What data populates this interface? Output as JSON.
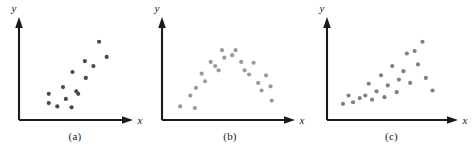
{
  "figure": {
    "background_color": "#ffffff",
    "panel_count": 3
  },
  "panels": [
    {
      "id": "panel-a",
      "caption": "(a)",
      "x_axis_label": "x",
      "y_axis_label": "y",
      "dot_color": "#4a4a4a",
      "axis_color": "#1a1a1a"
    },
    {
      "id": "panel-b",
      "caption": "(b)",
      "x_axis_label": "x",
      "y_axis_label": "y",
      "dot_color": "#9a9a9a",
      "axis_color": "#1a1a1a"
    },
    {
      "id": "panel-c",
      "caption": "(c)",
      "x_axis_label": "x",
      "y_axis_label": "y",
      "dot_color": "#808080",
      "axis_color": "#1a1a1a"
    }
  ],
  "chart_data": [
    {
      "type": "scatter",
      "title": "(a)",
      "xlabel": "x",
      "ylabel": "y",
      "grid": false,
      "legend": "none",
      "xlim": [
        0,
        100
      ],
      "ylim": [
        0,
        100
      ],
      "series": [
        {
          "name": "positive linear association",
          "color": "#4a4a4a",
          "points": [
            [
              25,
              24
            ],
            [
              25,
              13
            ],
            [
              34,
              9
            ],
            [
              40,
              32
            ],
            [
              43,
              18
            ],
            [
              49,
              8
            ],
            [
              50,
              50
            ],
            [
              54,
              27
            ],
            [
              56,
              24
            ],
            [
              63,
              63
            ],
            [
              64,
              43
            ],
            [
              72,
              57
            ],
            [
              78,
              86
            ],
            [
              86,
              68
            ]
          ]
        }
      ]
    },
    {
      "type": "scatter",
      "title": "(b)",
      "xlabel": "x",
      "ylabel": "y",
      "grid": false,
      "legend": "none",
      "xlim": [
        0,
        100
      ],
      "ylim": [
        0,
        100
      ],
      "series": [
        {
          "name": "curvilinear inverted-U association",
          "color": "#9a9a9a",
          "points": [
            [
              9,
              9
            ],
            [
              18,
              22
            ],
            [
              22,
              7
            ],
            [
              23,
              31
            ],
            [
              28,
              48
            ],
            [
              31,
              39
            ],
            [
              36,
              62
            ],
            [
              40,
              57
            ],
            [
              43,
              52
            ],
            [
              46,
              76
            ],
            [
              48,
              67
            ],
            [
              55,
              70
            ],
            [
              58,
              76
            ],
            [
              63,
              62
            ],
            [
              66,
              52
            ],
            [
              70,
              47
            ],
            [
              74,
              61
            ],
            [
              78,
              37
            ],
            [
              81,
              28
            ],
            [
              85,
              46
            ],
            [
              89,
              33
            ],
            [
              90,
              16
            ]
          ]
        }
      ]
    },
    {
      "type": "scatter",
      "title": "(c)",
      "xlabel": "x",
      "ylabel": "y",
      "grid": false,
      "legend": "none",
      "xlim": [
        0,
        100
      ],
      "ylim": [
        0,
        100
      ],
      "series": [
        {
          "name": "increasing association with fanning spread",
          "color": "#808080",
          "points": [
            [
              8,
              12
            ],
            [
              13,
              22
            ],
            [
              17,
              14
            ],
            [
              23,
              19
            ],
            [
              28,
              22
            ],
            [
              31,
              36
            ],
            [
              34,
              17
            ],
            [
              38,
              27
            ],
            [
              42,
              46
            ],
            [
              45,
              20
            ],
            [
              48,
              34
            ],
            [
              52,
              57
            ],
            [
              56,
              26
            ],
            [
              58,
              41
            ],
            [
              62,
              51
            ],
            [
              65,
              72
            ],
            [
              68,
              37
            ],
            [
              72,
              75
            ],
            [
              75,
              59
            ],
            [
              79,
              86
            ],
            [
              82,
              43
            ],
            [
              88,
              28
            ]
          ]
        }
      ]
    }
  ]
}
